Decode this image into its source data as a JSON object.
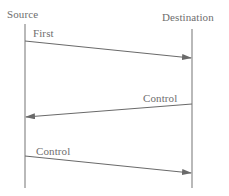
{
  "diagram": {
    "type": "sequence",
    "participants": [
      {
        "name": "Source",
        "x": 25
      },
      {
        "name": "Destination",
        "x": 192
      }
    ],
    "messages": [
      {
        "label": "First",
        "from": "Source",
        "to": "Destination",
        "y_start": 41,
        "y_end": 58
      },
      {
        "label": "Control",
        "from": "Destination",
        "to": "Source",
        "y_start": 104,
        "y_end": 117
      },
      {
        "label": "Control",
        "from": "Source",
        "to": "Destination",
        "y_start": 156,
        "y_end": 173
      }
    ],
    "colors": {
      "line": "#6a6a6a",
      "text": "#6e6e6e",
      "background": "#ffffff"
    }
  }
}
